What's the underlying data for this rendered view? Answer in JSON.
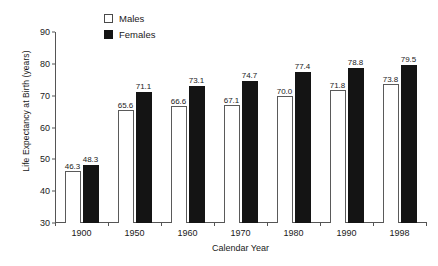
{
  "chart_data": {
    "type": "bar",
    "title": "",
    "xlabel": "Calendar Year",
    "ylabel": "Life Expectancy at Birth (years)",
    "categories": [
      "1900",
      "1950",
      "1960",
      "1970",
      "1980",
      "1990",
      "1998"
    ],
    "series": [
      {
        "name": "Males",
        "values": [
          46.3,
          65.6,
          66.6,
          67.1,
          70.0,
          71.8,
          73.8
        ]
      },
      {
        "name": "Females",
        "values": [
          48.3,
          71.1,
          73.1,
          74.7,
          77.4,
          78.8,
          79.5
        ]
      }
    ],
    "ylim": [
      30,
      90
    ],
    "yticks": [
      "30",
      "40",
      "50",
      "60",
      "70",
      "80",
      "90"
    ],
    "grid": false,
    "legend_position": "top-center",
    "colors": {
      "males": "#ffffff",
      "males_edge": "#5a5a5a",
      "females": "#141414",
      "axis": "#555555",
      "text": "#1a1a1a"
    }
  },
  "legend": {
    "items": [
      {
        "label": "Males",
        "swatch": "open-square-swatch"
      },
      {
        "label": "Females",
        "swatch": "filled-square-swatch"
      }
    ]
  }
}
